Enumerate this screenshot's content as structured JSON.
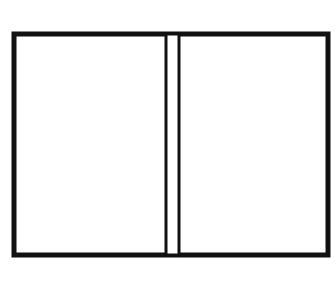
{
  "game": "backgammon",
  "colors": {
    "frame": "#111111",
    "shaded_point": "#c4c4c4",
    "plain_point": "#ffffff",
    "background": "#ffffff"
  },
  "top_labels": [
    "24",
    "23",
    "22",
    "21",
    "20",
    "19",
    "18",
    "17",
    "16",
    "15",
    "14",
    "13"
  ],
  "bottom_labels": [
    "1",
    "2",
    "3",
    "4",
    "5",
    "6",
    "7",
    "8",
    "9",
    "10",
    "11",
    "12"
  ],
  "points": [
    {
      "point": 1,
      "shaded": true,
      "checker": "O",
      "count": 2
    },
    {
      "point": 2,
      "shaded": false,
      "checker": "",
      "count": 0
    },
    {
      "point": 3,
      "shaded": true,
      "checker": "X",
      "count": 3
    },
    {
      "point": 4,
      "shaded": false,
      "checker": "X",
      "count": 2
    },
    {
      "point": 5,
      "shaded": true,
      "checker": "X",
      "count": 2
    },
    {
      "point": 6,
      "shaded": false,
      "checker": "X",
      "count": 3
    },
    {
      "point": 7,
      "shaded": true,
      "checker": "",
      "count": 0
    },
    {
      "point": 8,
      "shaded": false,
      "checker": "",
      "count": 0
    },
    {
      "point": 9,
      "shaded": true,
      "checker": "",
      "count": 0
    },
    {
      "point": 10,
      "shaded": false,
      "checker": "",
      "count": 0
    },
    {
      "point": 11,
      "shaded": true,
      "checker": "X",
      "count": 1
    },
    {
      "point": 12,
      "shaded": false,
      "checker": "O",
      "count": 3
    },
    {
      "point": 13,
      "shaded": true,
      "checker": "X",
      "count": 2
    },
    {
      "point": 14,
      "shaded": false,
      "checker": "O",
      "count": 1
    },
    {
      "point": 15,
      "shaded": true,
      "checker": "",
      "count": 0
    },
    {
      "point": 16,
      "shaded": false,
      "checker": "",
      "count": 0
    },
    {
      "point": 17,
      "shaded": true,
      "checker": "O",
      "count": 2
    },
    {
      "point": 18,
      "shaded": false,
      "checker": "",
      "count": 0
    },
    {
      "point": 19,
      "shaded": true,
      "checker": "O",
      "count": 3
    },
    {
      "point": 20,
      "shaded": false,
      "checker": "O",
      "count": 2
    },
    {
      "point": 21,
      "shaded": true,
      "checker": "",
      "count": 0
    },
    {
      "point": 22,
      "shaded": false,
      "checker": "O",
      "count": 2
    },
    {
      "point": 23,
      "shaded": true,
      "checker": "X",
      "count": 2
    },
    {
      "point": 24,
      "shaded": false,
      "checker": "",
      "count": 0
    }
  ]
}
